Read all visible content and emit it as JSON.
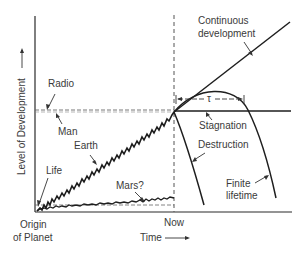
{
  "diagram": {
    "type": "conceptual development-over-time plot",
    "axes": {
      "y_label": "Level of Development —→",
      "x_label": "Time —→",
      "origin_label_line1": "Origin",
      "origin_label_line2": "of Planet",
      "now_label": "Now"
    },
    "labels": {
      "radio": "Radio",
      "man": "Man",
      "earth": "Earth",
      "life": "Life",
      "mars": "Mars?",
      "continuous_line1": "Continuous",
      "continuous_line2": "development",
      "stagnation": "Stagnation",
      "destruction": "Destruction",
      "finite_line1": "Finite",
      "finite_line2": "lifetime",
      "tau": "τ"
    },
    "curves": [
      {
        "name": "Earth",
        "style": "jagged rising"
      },
      {
        "name": "Mars?",
        "style": "jagged flat low"
      },
      {
        "name": "Continuous development",
        "style": "straight rising"
      },
      {
        "name": "Stagnation",
        "style": "horizontal"
      },
      {
        "name": "Destruction",
        "style": "steep decline"
      },
      {
        "name": "Finite lifetime",
        "style": "arch then decline"
      }
    ],
    "colors": {
      "ink": "#2a2a2a",
      "text": "#3a3a3a",
      "dashed": "#555555"
    }
  }
}
